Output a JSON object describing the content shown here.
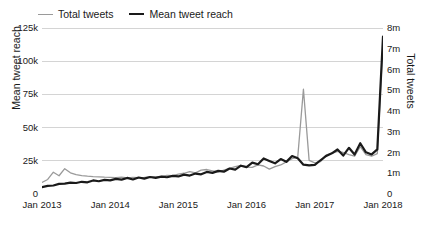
{
  "legend": {
    "position": "top-left",
    "entries": [
      {
        "label": "Total tweets",
        "color": "#9a9a9a",
        "style": "thin",
        "axis": "right"
      },
      {
        "label": "Mean tweet reach",
        "color": "#1a1a1a",
        "style": "thick",
        "axis": "left"
      }
    ]
  },
  "axes": {
    "left_title": "Mean tweet reach",
    "right_title": "Total tweets",
    "left_ticks": [
      "0",
      "25k",
      "50k",
      "75k",
      "100k",
      "125k"
    ],
    "right_ticks": [
      "0",
      "1m",
      "2m",
      "3m",
      "4m",
      "5m",
      "6m",
      "7m",
      "8m"
    ],
    "x_ticks": [
      "Jan 2013",
      "Jan 2014",
      "Jan 2015",
      "Jan 2016",
      "Jan 2017",
      "Jan 2018"
    ]
  },
  "chart_data": {
    "type": "line",
    "title": "",
    "xlabel": "",
    "ylabel": "Mean tweet reach",
    "y2label": "Total tweets",
    "grid": true,
    "legend_position": "top-left",
    "xlim": [
      "Jan 2013",
      "Jan 2018"
    ],
    "ylim": [
      0,
      125000
    ],
    "y2lim": [
      0,
      8000000
    ],
    "y_ticks": [
      0,
      25000,
      50000,
      75000,
      100000,
      125000
    ],
    "y_tick_labels": [
      "0",
      "25k",
      "50k",
      "75k",
      "100k",
      "125k"
    ],
    "y2_ticks": [
      0,
      1000000,
      2000000,
      3000000,
      4000000,
      5000000,
      6000000,
      7000000,
      8000000
    ],
    "y2_tick_labels": [
      "0",
      "1m",
      "2m",
      "3m",
      "4m",
      "5m",
      "6m",
      "7m",
      "8m"
    ],
    "x": [
      "Jan 2013",
      "Feb 2013",
      "Mar 2013",
      "Apr 2013",
      "May 2013",
      "Jun 2013",
      "Jul 2013",
      "Aug 2013",
      "Sep 2013",
      "Oct 2013",
      "Nov 2013",
      "Dec 2013",
      "Jan 2014",
      "Feb 2014",
      "Mar 2014",
      "Apr 2014",
      "May 2014",
      "Jun 2014",
      "Jul 2014",
      "Aug 2014",
      "Sep 2014",
      "Oct 2014",
      "Nov 2014",
      "Dec 2014",
      "Jan 2015",
      "Feb 2015",
      "Mar 2015",
      "Apr 2015",
      "May 2015",
      "Jun 2015",
      "Jul 2015",
      "Aug 2015",
      "Sep 2015",
      "Oct 2015",
      "Nov 2015",
      "Dec 2015",
      "Jan 2016",
      "Feb 2016",
      "Mar 2016",
      "Apr 2016",
      "May 2016",
      "Jun 2016",
      "Jul 2016",
      "Aug 2016",
      "Sep 2016",
      "Oct 2016",
      "Nov 2016",
      "Dec 2016",
      "Jan 2017",
      "Feb 2017",
      "Mar 2017",
      "Apr 2017",
      "May 2017",
      "Jun 2017",
      "Jul 2017",
      "Aug 2017",
      "Sep 2017",
      "Oct 2017",
      "Nov 2017",
      "Dec 2017",
      "Jan 2018"
    ],
    "x_tick_labels": [
      "Jan 2013",
      "Jan 2014",
      "Jan 2015",
      "Jan 2016",
      "Jan 2017",
      "Jan 2018"
    ],
    "x_tick_indices": [
      0,
      12,
      24,
      36,
      48,
      60
    ],
    "series": [
      {
        "name": "Total tweets",
        "axis": "right",
        "color": "#9a9a9a",
        "width": 1.3,
        "units": "tweets",
        "values": [
          560000,
          700000,
          1050000,
          880000,
          1220000,
          1020000,
          930000,
          890000,
          860000,
          840000,
          830000,
          810000,
          800000,
          790000,
          810000,
          780000,
          800000,
          790000,
          800000,
          820000,
          830000,
          850000,
          900000,
          880000,
          960000,
          1000000,
          1080000,
          1020000,
          1150000,
          1180000,
          1120000,
          1060000,
          1150000,
          1240000,
          1320000,
          1380000,
          1300000,
          1280000,
          1400000,
          1350000,
          1200000,
          1320000,
          1400000,
          1550000,
          1700000,
          1780000,
          5050000,
          1620000,
          1500000,
          1560000,
          1880000,
          1960000,
          2050000,
          2000000,
          1900000,
          1820000,
          2280000,
          1900000,
          1820000,
          1950000,
          7320000
        ]
      },
      {
        "name": "Mean tweet reach",
        "axis": "left",
        "color": "#1a1a1a",
        "width": 2.2,
        "units": "reach",
        "values": [
          5200,
          6100,
          6400,
          7600,
          7800,
          8500,
          8300,
          9200,
          8800,
          10200,
          9600,
          10600,
          10300,
          11400,
          10800,
          12100,
          10900,
          12400,
          11600,
          12800,
          12200,
          13100,
          12600,
          13600,
          13200,
          14600,
          13900,
          15400,
          14800,
          16600,
          15900,
          17400,
          16800,
          19200,
          18400,
          21300,
          20200,
          23600,
          22400,
          26800,
          24900,
          23100,
          26300,
          24200,
          28600,
          26900,
          22100,
          21600,
          21900,
          25400,
          28700,
          30600,
          33500,
          28900,
          34800,
          29700,
          38200,
          31400,
          29800,
          33600,
          118600
        ]
      }
    ],
    "annotations": [
      {
        "text": "Total tweets spike",
        "x": "Nov 2016",
        "value": 5050000
      },
      {
        "text": "Total tweets peak",
        "x": "Jan 2018",
        "value": 7320000
      },
      {
        "text": "Mean tweet reach peak",
        "x": "Jan 2018",
        "value": 118600
      }
    ]
  }
}
